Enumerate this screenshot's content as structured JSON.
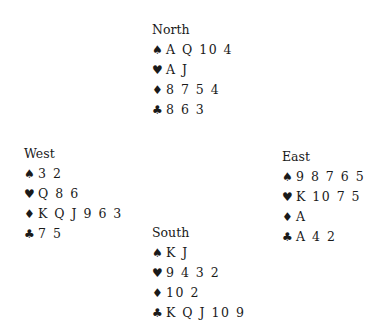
{
  "hands": {
    "north": {
      "name": "North",
      "spades": "A Q 10 4",
      "hearts": "A J",
      "diamonds": "8 7 5 4",
      "clubs": "8 6 3"
    },
    "west": {
      "name": "West",
      "spades": "3 2",
      "hearts": "Q 8 6",
      "diamonds": "K Q J 9 6 3",
      "clubs": "7 5"
    },
    "east": {
      "name": "East",
      "spades": "9 8 7 6 5",
      "hearts": "K 10 7 5",
      "diamonds": "A",
      "clubs": "A 4 2"
    },
    "south": {
      "name": "South",
      "spades": "K J",
      "hearts": "9 4 3 2",
      "diamonds": "10 2",
      "clubs": "K Q J 10 9"
    }
  },
  "suit_symbols": {
    "spades": "♠",
    "hearts": "♥",
    "diamonds": "♦",
    "clubs": "♣"
  }
}
